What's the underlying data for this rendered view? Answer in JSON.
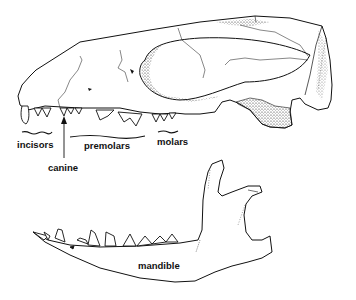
{
  "diagram": {
    "type": "anatomical-line-drawing",
    "colors": {
      "background": "#ffffff",
      "ink": "#111111"
    },
    "labels": {
      "incisors": "incisors",
      "canine": "canine",
      "premolars": "premolars",
      "molars": "molars",
      "mandible": "mandible"
    },
    "parts": [
      "cranium",
      "upper-teeth",
      "mandible",
      "lower-teeth"
    ]
  }
}
